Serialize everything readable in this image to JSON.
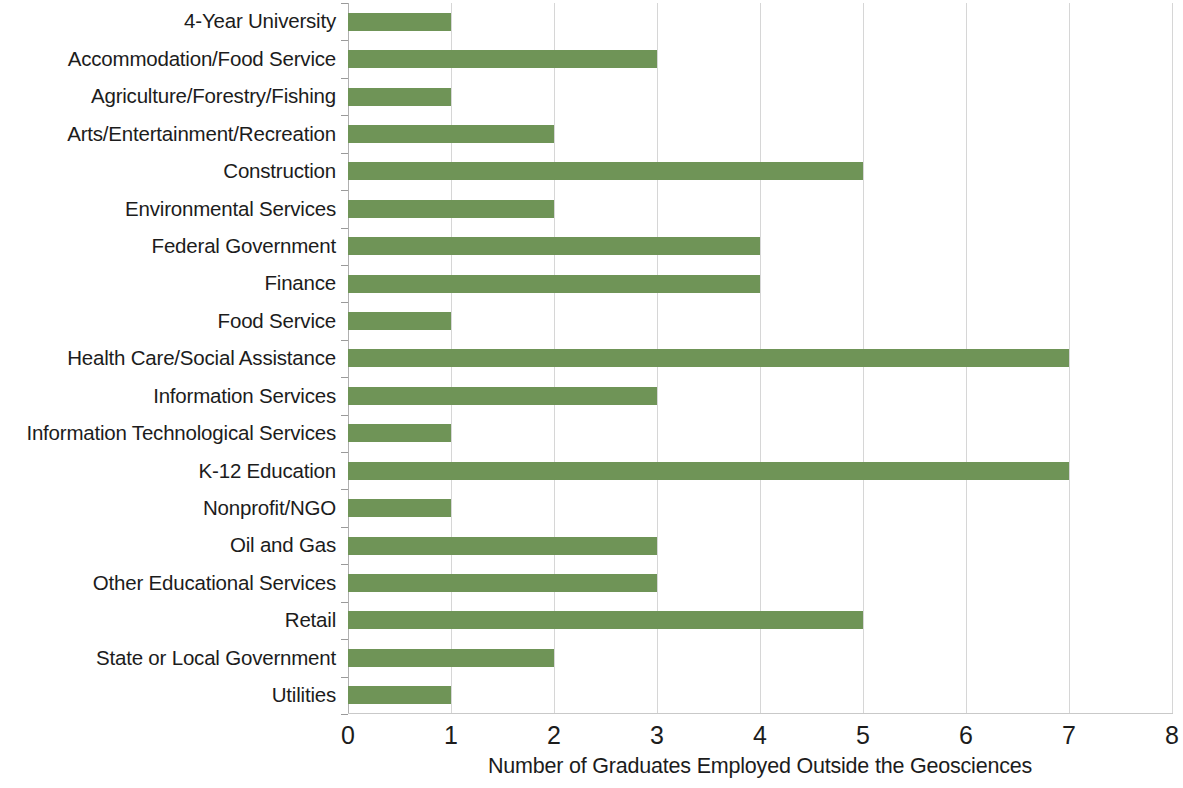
{
  "chart_data": {
    "type": "bar",
    "orientation": "horizontal",
    "title": "",
    "xlabel": "Number of Graduates Employed Outside the Geosciences",
    "ylabel": "",
    "xlim": [
      0,
      8
    ],
    "xticks": [
      "0",
      "1",
      "2",
      "3",
      "4",
      "5",
      "6",
      "7",
      "8"
    ],
    "grid": "vertical",
    "legend": "none",
    "bar_color": "#6f9457",
    "gridline_color": "#d6d6d6",
    "categories": [
      "4-Year University",
      "Accommodation/Food Service",
      "Agriculture/Forestry/Fishing",
      "Arts/Entertainment/Recreation",
      "Construction",
      "Environmental Services",
      "Federal Government",
      "Finance",
      "Food Service",
      "Health Care/Social Assistance",
      "Information Services",
      "Information Technological Services",
      "K-12 Education",
      "Nonprofit/NGO",
      "Oil and Gas",
      "Other Educational Services",
      "Retail",
      "State or Local Government",
      "Utilities"
    ],
    "values": [
      1,
      3,
      1,
      2,
      5,
      2,
      4,
      4,
      1,
      7,
      3,
      1,
      7,
      1,
      3,
      3,
      5,
      2,
      1
    ]
  }
}
